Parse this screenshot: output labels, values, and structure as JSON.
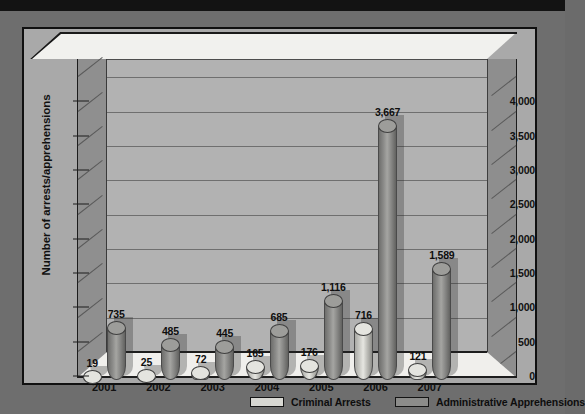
{
  "chart_data": {
    "type": "bar",
    "title": "",
    "xlabel": "",
    "ylabel": "Number of arrests/apprehensions",
    "categories": [
      "2001",
      "2002",
      "2003",
      "2004",
      "2005",
      "2006",
      "2007"
    ],
    "series": [
      {
        "name": "Criminal Arrests",
        "color": "#d8d8d3",
        "values": [
          19,
          25,
          72,
          165,
          176,
          716,
          121
        ],
        "labels": [
          "19",
          "25",
          "72",
          "165",
          "176",
          "716",
          "121"
        ]
      },
      {
        "name": "Administrative Apprehensions",
        "color": "#8c8c8a",
        "values": [
          735,
          485,
          445,
          685,
          1116,
          3667,
          1589
        ],
        "labels": [
          "735",
          "485",
          "445",
          "685",
          "1,116",
          "3,667",
          "1,589"
        ]
      }
    ],
    "ylim": [
      0,
      4250
    ],
    "yticks": [
      0,
      500,
      1000,
      1500,
      2000,
      2500,
      3000,
      3500,
      4000
    ],
    "ytick_labels": [
      "0",
      "500",
      "1,000",
      "1,500",
      "2,000",
      "2,500",
      "3,000",
      "3,500",
      "4,000"
    ],
    "grid": true,
    "legend_position": "bottom",
    "style": "3d-cylinder"
  },
  "legend": {
    "items": [
      {
        "label": "Criminal Arrests",
        "swatch": "crim"
      },
      {
        "label": "Administrative Apprehensions",
        "swatch": "admin"
      }
    ]
  }
}
